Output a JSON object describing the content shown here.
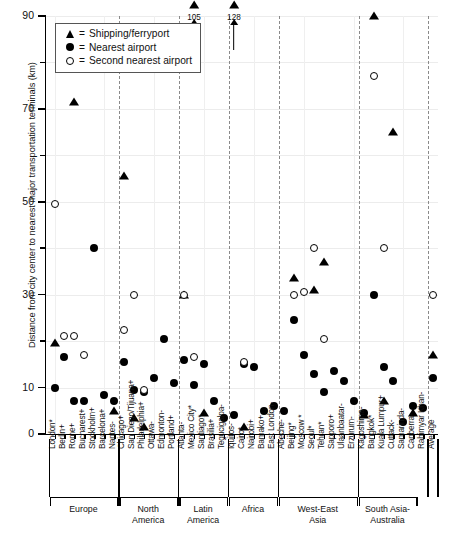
{
  "chart": {
    "ylabel": "Distance from city center to nearest major transportation terminals (km)",
    "yticks": [
      "0",
      "10",
      "30",
      "50",
      "70",
      "90"
    ],
    "ylim": [
      0,
      90
    ],
    "average_label": "Average"
  },
  "legend": {
    "items": [
      {
        "marker": "triangle",
        "eq": "=",
        "label": "Shipping/ferryport"
      },
      {
        "marker": "dot",
        "eq": "=",
        "label": "Nearest airport"
      },
      {
        "marker": "open-dot",
        "eq": "=",
        "label": "Second nearest airport"
      }
    ]
  },
  "regions": [
    {
      "name": "Europe",
      "first": 0,
      "last": 6
    },
    {
      "name": "North\nAmerica",
      "first": 7,
      "last": 12
    },
    {
      "name": "Latin\nAmerica",
      "first": 13,
      "last": 17
    },
    {
      "name": "Africa",
      "first": 18,
      "last": 22
    },
    {
      "name": "West-East\nAsia",
      "first": 23,
      "last": 30
    },
    {
      "name": "South Asia-\nAustralia",
      "first": 31,
      "last": 36
    }
  ],
  "chart_data": {
    "type": "scatter",
    "title": "",
    "xlabel": "",
    "ylabel": "Distance from city center to nearest major transportation terminals (km)",
    "ylim": [
      0,
      90
    ],
    "yticks": [
      0,
      10,
      30,
      50,
      70,
      90
    ],
    "grid": true,
    "legend_position": "top-left",
    "categories": [
      "London*",
      "Berlin+",
      "Rome+",
      "Bucharest+",
      "Stockholm+",
      "Barcelona+",
      "Nantes-",
      "Chicago+",
      "San Diego/Tijuana+",
      "Philadelphia+",
      "Ottawa-",
      "Edmonton-",
      "Portland+",
      "Atlanta-",
      "Mexico City*",
      "Santiago*",
      "Brasilia+",
      "Tegucigalpa-",
      "Iquitos-",
      "Cairo*",
      "Nairobi+",
      "Bamako+",
      "East London-",
      "Abeche-",
      "Beijing*",
      "Moscow *",
      "Seoul*",
      "Tehran*",
      "Sapporo+",
      "Ulaanbaatar-",
      "Erzurum-",
      "Kagoshima-",
      "Bangkok*",
      "Kuala Lumpur+",
      "Cuttack-",
      "Samarinda-",
      "Canberra-",
      "Rahimyar Khan-",
      "Average"
    ],
    "series": [
      {
        "name": "Shipping/ferryport",
        "marker": "triangle",
        "points": [
          {
            "x": "London*",
            "y": 19.5
          },
          {
            "x": "Rome+",
            "y": 71.5
          },
          {
            "x": "Nantes-",
            "y": 5.0
          },
          {
            "x": "Chicago+",
            "y": 55.5
          },
          {
            "x": "San Diego/Tijuana+",
            "y": 3.5
          },
          {
            "x": "Philadelphia+",
            "y": 1.5
          },
          {
            "x": "Atlanta-",
            "y": 30.0
          },
          {
            "x": "Mexico City*",
            "y": 105.0,
            "offscale": true,
            "label": "105"
          },
          {
            "x": "Santiago*",
            "y": 4.5
          },
          {
            "x": "Iquitos-",
            "y": 128.0,
            "offscale": true,
            "label": "128"
          },
          {
            "x": "Cairo*",
            "y": 1.5
          },
          {
            "x": "Beijing*",
            "y": 33.5
          },
          {
            "x": "Seoul*",
            "y": 31.0
          },
          {
            "x": "Tehran*",
            "y": 37.0
          },
          {
            "x": "Kagoshima-",
            "y": 4.0
          },
          {
            "x": "Bangkok*",
            "y": 90.0
          },
          {
            "x": "Kuala Lumpur+",
            "y": 7.0
          },
          {
            "x": "Cuttack-",
            "y": 65.0
          },
          {
            "x": "Canberra-",
            "y": 4.5
          },
          {
            "x": "Average",
            "y": 17.0
          }
        ]
      },
      {
        "name": "Nearest airport",
        "marker": "dot",
        "points": [
          {
            "x": "London*",
            "y": 10.0
          },
          {
            "x": "Berlin+",
            "y": 16.5
          },
          {
            "x": "Rome+",
            "y": 7.0
          },
          {
            "x": "Bucharest+",
            "y": 7.0
          },
          {
            "x": "Stockholm+",
            "y": 40.0
          },
          {
            "x": "Barcelona+",
            "y": 8.5
          },
          {
            "x": "Nantes-",
            "y": 7.0
          },
          {
            "x": "Chicago+",
            "y": 15.5
          },
          {
            "x": "San Diego/Tijuana+",
            "y": 9.5
          },
          {
            "x": "Philadelphia+",
            "y": 9.0
          },
          {
            "x": "Ottawa-",
            "y": 12.0
          },
          {
            "x": "Edmonton-",
            "y": 20.5
          },
          {
            "x": "Portland+",
            "y": 11.0
          },
          {
            "x": "Atlanta-",
            "y": 16.0
          },
          {
            "x": "Mexico City*",
            "y": 10.5
          },
          {
            "x": "Santiago*",
            "y": 15.0
          },
          {
            "x": "Brasilia+",
            "y": 7.0
          },
          {
            "x": "Tegucigalpa-",
            "y": 3.5
          },
          {
            "x": "Iquitos-",
            "y": 4.0
          },
          {
            "x": "Cairo*",
            "y": 15.0
          },
          {
            "x": "Nairobi+",
            "y": 14.5
          },
          {
            "x": "Bamako+",
            "y": 5.0
          },
          {
            "x": "East London-",
            "y": 6.0
          },
          {
            "x": "Abeche-",
            "y": 5.0
          },
          {
            "x": "Beijing*",
            "y": 24.5
          },
          {
            "x": "Moscow *",
            "y": 17.0
          },
          {
            "x": "Seoul*",
            "y": 13.0
          },
          {
            "x": "Tehran*",
            "y": 9.0
          },
          {
            "x": "Sapporo+",
            "y": 13.5
          },
          {
            "x": "Ulaanbaatar-",
            "y": 11.5
          },
          {
            "x": "Erzurum-",
            "y": 7.0
          },
          {
            "x": "Kagoshima-",
            "y": 4.5
          },
          {
            "x": "Bangkok*",
            "y": 30.0
          },
          {
            "x": "Kuala Lumpur+",
            "y": 14.5
          },
          {
            "x": "Cuttack-",
            "y": 11.5
          },
          {
            "x": "Samarinda-",
            "y": 2.5
          },
          {
            "x": "Canberra-",
            "y": 6.0
          },
          {
            "x": "Rahimyar Khan-",
            "y": 5.5
          },
          {
            "x": "Average",
            "y": 12.0
          }
        ]
      },
      {
        "name": "Second nearest airport",
        "marker": "open-dot",
        "points": [
          {
            "x": "London*",
            "y": 49.5
          },
          {
            "x": "Berlin+",
            "y": 21.0
          },
          {
            "x": "Rome+",
            "y": 21.0
          },
          {
            "x": "Bucharest+",
            "y": 17.0
          },
          {
            "x": "Chicago+",
            "y": 22.5
          },
          {
            "x": "San Diego/Tijuana+",
            "y": 30.0
          },
          {
            "x": "Philadelphia+",
            "y": 9.5
          },
          {
            "x": "Atlanta-",
            "y": 30.0
          },
          {
            "x": "Mexico City*",
            "y": 16.5
          },
          {
            "x": "Cairo*",
            "y": 15.5
          },
          {
            "x": "Beijing*",
            "y": 30.0
          },
          {
            "x": "Moscow *",
            "y": 30.5
          },
          {
            "x": "Seoul*",
            "y": 40.0
          },
          {
            "x": "Tehran*",
            "y": 20.5
          },
          {
            "x": "Bangkok*",
            "y": 77.0
          },
          {
            "x": "Kuala Lumpur+",
            "y": 40.0
          },
          {
            "x": "Average",
            "y": 30.0
          }
        ]
      }
    ]
  }
}
